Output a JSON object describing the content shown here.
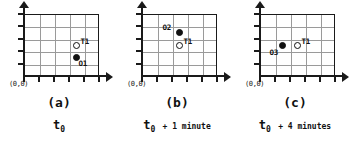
{
  "figure": {
    "background_color": "#ffffff",
    "line_color": "#1a1a1a",
    "grid_color": "#9a9a9a",
    "marker_color": "#111111",
    "grid_columns": 5,
    "grid_rows": 5
  },
  "panels": [
    {
      "id": "a",
      "caption_letter": "(a)",
      "origin_label": "(0,0)",
      "time_prefix": "t",
      "time_subscript": "0",
      "time_suffix": "",
      "time_full": "t0",
      "markers": [
        {
          "id": "T1",
          "label": "T1",
          "type": "hollow",
          "col": 4,
          "row": 3,
          "label_side": "right"
        },
        {
          "id": "O1",
          "label": "O1",
          "type": "filled",
          "col": 4,
          "row": 4,
          "label_side": "below-right"
        }
      ]
    },
    {
      "id": "b",
      "caption_letter": "(b)",
      "origin_label": "(0,0)",
      "time_prefix": "t",
      "time_subscript": "0",
      "time_suffix": "+ 1 minute",
      "time_full": "t0 + 1 minute",
      "markers": [
        {
          "id": "O2",
          "label": "O2",
          "type": "filled",
          "col": 3,
          "row": 2,
          "label_side": "left"
        },
        {
          "id": "T1",
          "label": "T1",
          "type": "hollow",
          "col": 3,
          "row": 3,
          "label_side": "right"
        }
      ]
    },
    {
      "id": "c",
      "caption_letter": "(c)",
      "origin_label": "(0,0)",
      "time_prefix": "t",
      "time_subscript": "0",
      "time_suffix": "+ 4 minutes",
      "time_full": "t0 + 4 minutes",
      "markers": [
        {
          "id": "O3",
          "label": "O3",
          "type": "filled",
          "col": 2,
          "row": 3,
          "label_side": "below-left"
        },
        {
          "id": "T1",
          "label": "T1",
          "type": "hollow",
          "col": 3,
          "row": 3,
          "label_side": "right"
        }
      ]
    }
  ]
}
